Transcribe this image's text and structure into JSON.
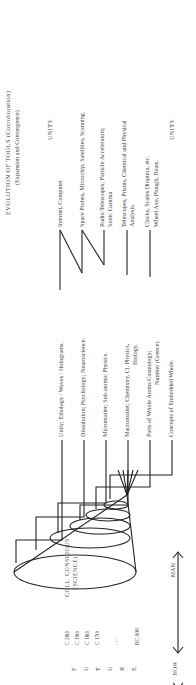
{
  "header": {
    "title": "EVOLUTION OF TOOLS (Corroboration)",
    "subtitle": "(Expansion and Convergence)",
    "unity_top": "UNITY",
    "unity_bottom": "UNITY"
  },
  "cone": {
    "top_label_line1": "COLL. CONSCIOUS",
    "top_label_line2": "(SCIENCE)",
    "apex_label": "MAN"
  },
  "science_levels": [
    {
      "label": "Unity; Ethology / Waves / Holograms."
    },
    {
      "label": "Dissolution; Psychology; Neuroscience."
    },
    {
      "label": "Micromatter; Sub-atomic Physics."
    },
    {
      "label": "Macromatter; Chemistry, Cl. Physics,",
      "label2": "Biology."
    },
    {
      "label": "Parts of Whole Atoms Cosmology;",
      "label2": "Number (Greece)."
    },
    {
      "label": "Concepts of Embedded Whole."
    }
  ],
  "tools": [
    {
      "label": "Internet, Computer"
    },
    {
      "label": "Space Probes, Microchip, Satellites, Scanning."
    },
    {
      "label": "Radio Telescopes; Particle Accelerators;",
      "label2": "Sonic Gamma"
    },
    {
      "label": "Telescopes, Prisms, Chemical and Physical",
      "label2": "Analysis."
    },
    {
      "label": "Clocks, Scales Dioptera, etc.",
      "label2": "Wheel Axe, Plough, Boats."
    }
  ],
  "timeline": {
    "axis_letters": [
      "F",
      "U",
      "T",
      "U",
      "R",
      "E"
    ],
    "ticks": [
      "C 20th",
      "C 19th",
      "C 18th",
      "C 17th",
      ". . .",
      "BC 600"
    ],
    "now_label": "NOW"
  }
}
